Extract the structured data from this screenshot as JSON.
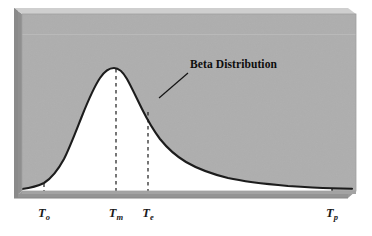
{
  "figure": {
    "title": "Beta Distribution",
    "annotation_label": "Beta Distribution",
    "background_color": "#ffffff",
    "plot_fill_color": "#aeaeae",
    "under_curve_fill_color": "#ffffff",
    "curve_color": "#1a1a1a",
    "axis_bar_color": "#949494",
    "bevel_light_color": "#c9c9c9",
    "bevel_dark_color": "#8a8a8a",
    "dashed_line_color": "#1a1a1a"
  },
  "axis": {
    "ticks": [
      {
        "name": "optimistic-time",
        "label": "T",
        "subscript": "o",
        "x": 44
      },
      {
        "name": "most-likely-time",
        "label": "T",
        "subscript": "m",
        "x": 116
      },
      {
        "name": "expected-time",
        "label": "T",
        "subscript": "e",
        "x": 148
      },
      {
        "name": "pessimistic-time",
        "label": "T",
        "subscript": "p",
        "x": 332
      }
    ]
  },
  "chart_data": {
    "type": "area",
    "title": "Beta Distribution",
    "xlabel": "",
    "ylabel": "",
    "grid": false,
    "legend": "none",
    "annotations": [
      {
        "text": "Beta Distribution",
        "text_x": 190,
        "text_y": 66,
        "leader_from_x": 188,
        "leader_from_y": 73,
        "leader_to_x": 159,
        "leader_to_y": 98
      }
    ],
    "marker_labels": [
      "To",
      "Tm",
      "Te",
      "Tp"
    ],
    "marker_x": [
      44,
      116,
      148,
      332
    ],
    "marker_descriptions": [
      "Optimistic time",
      "Most likely time",
      "Expected time",
      "Pessimistic time"
    ],
    "x": [
      22,
      30,
      38,
      44,
      52,
      60,
      68,
      76,
      84,
      92,
      100,
      106,
      112,
      116,
      124,
      132,
      140,
      148,
      156,
      164,
      174,
      184,
      196,
      210,
      226,
      244,
      264,
      286,
      308,
      332,
      348
    ],
    "y": [
      0.02,
      0.05,
      0.1,
      0.15,
      0.26,
      0.42,
      0.6,
      0.76,
      0.88,
      0.96,
      1.0,
      1.0,
      0.99,
      0.97,
      0.92,
      0.85,
      0.77,
      0.69,
      0.61,
      0.54,
      0.46,
      0.39,
      0.32,
      0.25,
      0.19,
      0.14,
      0.1,
      0.07,
      0.045,
      0.025,
      0.02
    ],
    "ylim": [
      0,
      1.05
    ],
    "xlim": [
      16,
      356
    ],
    "note": "y values are normalized curve heights (peak = 1.0 at the mode Tm); x values are pixel positions along the horizontal time axis"
  }
}
